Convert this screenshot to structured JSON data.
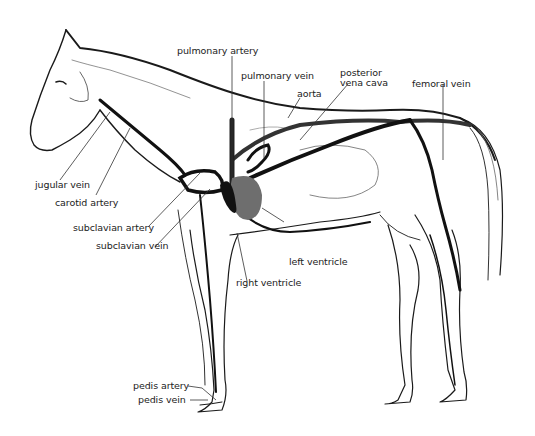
{
  "diagram": {
    "colors": {
      "outline": "#1a1a1a",
      "vessel": "#111111",
      "heart": "#6e6e6e",
      "leader_line": "#333333",
      "background": "#ffffff"
    },
    "labels": {
      "pulmonary_artery": "pulmonary artery",
      "pulmonary_vein": "pulmonary vein",
      "aorta": "aorta",
      "posterior_vena_cava_1": "posterior",
      "posterior_vena_cava_2": "vena cava",
      "femoral_vein": "femoral vein",
      "jugular_vein": "jugular vein",
      "carotid_artery": "carotid artery",
      "subclavian_artery": "subclavian artery",
      "subclavian_vein": "subclavian vein",
      "left_ventricle": "left ventricle",
      "right_ventricle": "right ventricle",
      "pedis_artery": "pedis artery",
      "pedis_vein": "pedis vein"
    }
  }
}
